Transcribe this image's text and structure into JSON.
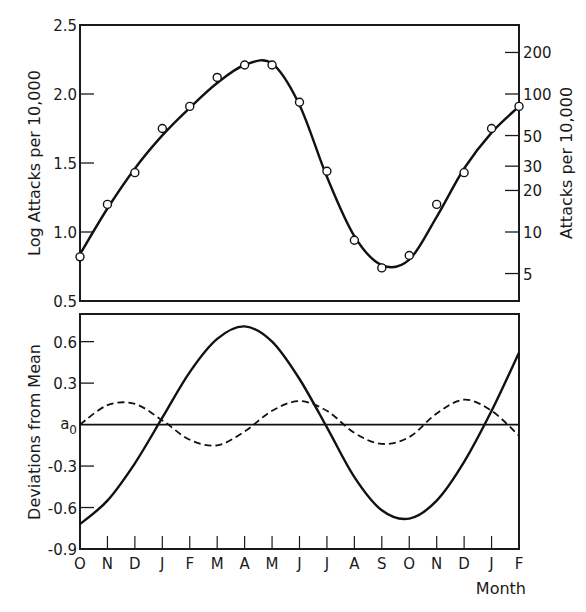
{
  "chart_data": [
    {
      "id": "top",
      "type": "line",
      "title": "",
      "xlabel": "",
      "ylabel": "Log Attacks per 10,000",
      "ylabel_right": "Attacks per 10,000",
      "ylim": [
        0.5,
        2.5
      ],
      "yticks": [
        "0.5",
        "1.0",
        "1.5",
        "2.0",
        "2.5"
      ],
      "ytick_values": [
        0.5,
        1.0,
        1.5,
        2.0,
        2.5
      ],
      "right_ticks": [
        "5",
        "10",
        "20",
        "30",
        "50",
        "100",
        "200"
      ],
      "right_tick_values": [
        5,
        10,
        20,
        30,
        50,
        100,
        200
      ],
      "grid": false,
      "categories": [
        "O",
        "N",
        "D",
        "J",
        "F",
        "M",
        "A",
        "M",
        "J",
        "J",
        "A",
        "S",
        "O",
        "N",
        "D",
        "J",
        "F"
      ],
      "series": [
        {
          "name": "Observed (points)",
          "style": "open-circle",
          "values": [
            0.82,
            1.2,
            1.43,
            1.75,
            1.91,
            2.12,
            2.21,
            2.21,
            1.94,
            1.44,
            0.94,
            0.74,
            0.83,
            1.2,
            1.43,
            1.75,
            1.91
          ]
        },
        {
          "name": "Fitted curve",
          "style": "solid",
          "values": [
            0.84,
            1.17,
            1.46,
            1.7,
            1.9,
            2.08,
            2.21,
            2.22,
            1.92,
            1.4,
            0.97,
            0.76,
            0.8,
            1.11,
            1.46,
            1.72,
            1.91
          ]
        }
      ]
    },
    {
      "id": "bottom",
      "type": "line",
      "title": "",
      "xlabel": "Month",
      "ylabel": "Deviations from Mean",
      "ylim": [
        -0.9,
        0.8
      ],
      "yticks": [
        "-0.9",
        "-0.6",
        "-0.3",
        "a0",
        "0.3",
        "0.6"
      ],
      "ytick_values": [
        -0.9,
        -0.6,
        -0.3,
        0,
        0.3,
        0.6
      ],
      "zero_label": "a",
      "zero_label_sub": "0",
      "grid": false,
      "categories": [
        "O",
        "N",
        "D",
        "J",
        "F",
        "M",
        "A",
        "M",
        "J",
        "J",
        "A",
        "S",
        "O",
        "N",
        "D",
        "J",
        "F"
      ],
      "series": [
        {
          "name": "First harmonic",
          "style": "solid",
          "values": [
            -0.72,
            -0.55,
            -0.28,
            0.05,
            0.38,
            0.62,
            0.71,
            0.6,
            0.33,
            -0.02,
            -0.38,
            -0.62,
            -0.68,
            -0.55,
            -0.27,
            0.1,
            0.52
          ]
        },
        {
          "name": "Second harmonic",
          "style": "dashed",
          "values": [
            0.0,
            0.14,
            0.15,
            0.03,
            -0.11,
            -0.15,
            -0.05,
            0.1,
            0.17,
            0.1,
            -0.06,
            -0.14,
            -0.09,
            0.08,
            0.18,
            0.1,
            -0.08
          ]
        },
        {
          "name": "Mean line",
          "style": "baseline",
          "values": [
            0,
            0
          ]
        }
      ]
    }
  ],
  "figure": {
    "x_axis_label": "Month",
    "month_labels": [
      "O",
      "N",
      "D",
      "J",
      "F",
      "M",
      "A",
      "M",
      "J",
      "J",
      "A",
      "S",
      "O",
      "N",
      "D",
      "J",
      "F"
    ]
  }
}
